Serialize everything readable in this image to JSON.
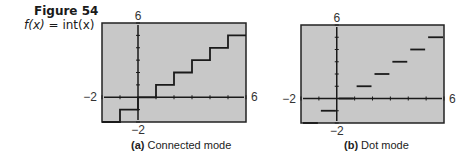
{
  "figure": {
    "title": "Figure 54",
    "function_lhs": "f(x)",
    "function_eq": "=",
    "function_rhs": "int(x)"
  },
  "panels": [
    {
      "id": "a",
      "caption_tag": "(a)",
      "caption_text": "Connected mode",
      "xmin_label": "−2",
      "xmax_label": "6",
      "ymax_label": "6",
      "ymin_label": "−2"
    },
    {
      "id": "b",
      "caption_tag": "(b)",
      "caption_text": "Dot mode",
      "xmin_label": "−2",
      "xmax_label": "6",
      "ymax_label": "6",
      "ymin_label": "−2"
    }
  ],
  "colors": {
    "screen_bg": "#c8c8c8",
    "line": "#1a1a1a",
    "frame": "#222222"
  },
  "chart_data": [
    {
      "type": "line",
      "title": "(a) Connected mode",
      "function": "f(x) = int(x)",
      "xlim": [
        -2,
        6
      ],
      "ylim": [
        -2,
        6
      ],
      "x_ticks_step": 1,
      "y_ticks_step": 1,
      "mode": "connected",
      "x": [
        -2,
        -1,
        -1,
        0,
        0,
        1,
        1,
        2,
        2,
        3,
        3,
        4,
        4,
        5,
        5,
        6
      ],
      "y": [
        -2,
        -2,
        -1,
        -1,
        0,
        0,
        1,
        1,
        2,
        2,
        3,
        3,
        4,
        4,
        5,
        5
      ],
      "grid": false
    },
    {
      "type": "scatter",
      "title": "(b) Dot mode",
      "function": "f(x) = int(x)",
      "xlim": [
        -2,
        6
      ],
      "ylim": [
        -2,
        6
      ],
      "x_ticks_step": 1,
      "y_ticks_step": 1,
      "mode": "dot",
      "segments": [
        {
          "x": [
            -2,
            -1
          ],
          "y": -2
        },
        {
          "x": [
            -1,
            0
          ],
          "y": -1
        },
        {
          "x": [
            0,
            1
          ],
          "y": 0
        },
        {
          "x": [
            1,
            2
          ],
          "y": 1
        },
        {
          "x": [
            2,
            3
          ],
          "y": 2
        },
        {
          "x": [
            3,
            4
          ],
          "y": 3
        },
        {
          "x": [
            4,
            5
          ],
          "y": 4
        },
        {
          "x": [
            5,
            6
          ],
          "y": 5
        }
      ],
      "grid": false
    }
  ]
}
